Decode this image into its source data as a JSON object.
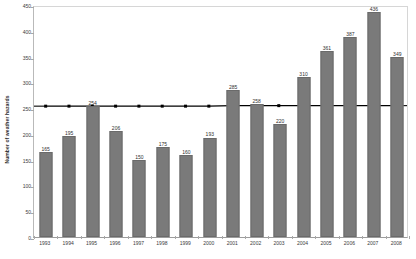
{
  "chart_data": {
    "type": "bar",
    "title": "",
    "xlabel": "",
    "ylabel": "Number of weather hazards",
    "ylim": [
      0,
      450
    ],
    "ytick_step": 50,
    "yticks": [
      0,
      50,
      100,
      150,
      200,
      250,
      300,
      350,
      400,
      450
    ],
    "grid": false,
    "legend": "none",
    "bar_color": "#7a7a7a",
    "trendline_color": "#000000",
    "categories": [
      "1993",
      "1994",
      "1995",
      "1996",
      "1997",
      "1998",
      "1999",
      "2000",
      "2001",
      "2002",
      "2003",
      "2004",
      "2005",
      "2006",
      "2007",
      "2008"
    ],
    "values": [
      165,
      195,
      254,
      206,
      150,
      175,
      160,
      193,
      285,
      258,
      220,
      310,
      361,
      387,
      436,
      349
    ],
    "data_labels": [
      "165",
      "195",
      "254",
      "206",
      "150",
      "175",
      "160",
      "193",
      "285",
      "258",
      "220",
      "310",
      "361",
      "387",
      "436",
      "349"
    ],
    "series": [
      {
        "name": "Number of weather hazards",
        "type": "bar",
        "values": [
          165,
          195,
          254,
          206,
          150,
          175,
          160,
          193,
          285,
          258,
          220,
          310,
          361,
          387,
          436,
          349
        ]
      },
      {
        "name": "trendline",
        "type": "line",
        "values": [
          256,
          256,
          256,
          256,
          256,
          256,
          256,
          256,
          257,
          257,
          257,
          257,
          257,
          257,
          257,
          257
        ]
      }
    ]
  }
}
